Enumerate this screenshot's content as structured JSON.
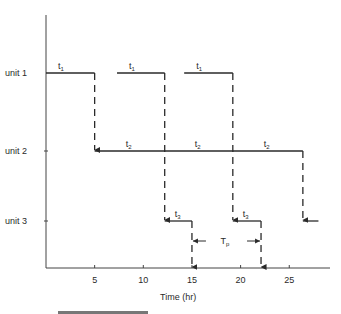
{
  "diagram": {
    "type": "schedule-gantt",
    "units": [
      {
        "label": "unit 1"
      },
      {
        "label": "unit 2"
      },
      {
        "label": "unit 3"
      }
    ],
    "x_axis": {
      "label": "Time (hr)",
      "ticks": [
        "5",
        "10",
        "15",
        "20",
        "25"
      ],
      "tick_values": [
        5,
        10,
        15,
        20,
        25
      ],
      "range": [
        0,
        29
      ]
    },
    "segments": {
      "unit1": [
        {
          "label": "t",
          "sub": "1",
          "start": 0,
          "end": 5
        },
        {
          "label": "t",
          "sub": "1",
          "start": 7.3,
          "end": 12.2
        },
        {
          "label": "t",
          "sub": "1",
          "start": 14.2,
          "end": 19.2
        }
      ],
      "unit2": [
        {
          "label": "t",
          "sub": "2",
          "start": 5,
          "end": 12.2
        },
        {
          "label": "t",
          "sub": "2",
          "start": 12.2,
          "end": 19.2
        },
        {
          "label": "t",
          "sub": "2",
          "start": 19.2,
          "end": 26.4
        }
      ],
      "unit3": [
        {
          "label": "t",
          "sub": "3",
          "start": 12.2,
          "end": 15
        },
        {
          "label": "t",
          "sub": "3",
          "start": 19.2,
          "end": 22.1
        },
        {
          "label": "",
          "sub": "",
          "start": 26.4,
          "end": 28
        }
      ]
    },
    "transfers": [
      {
        "time": 5,
        "from": 1,
        "to": 2
      },
      {
        "time": 12.2,
        "from": 1,
        "to": 3
      },
      {
        "time": 19.2,
        "from": 1,
        "to": 3
      },
      {
        "time": 26.4,
        "from": 2,
        "to": 3
      },
      {
        "time": 15,
        "from": 3,
        "to": "axis"
      },
      {
        "time": 22.1,
        "from": 3,
        "to": "axis"
      }
    ],
    "period_marker": {
      "label": "T",
      "sub": "p",
      "start": 15,
      "end": 22.1
    },
    "caption_partial": "Time (hr)"
  }
}
